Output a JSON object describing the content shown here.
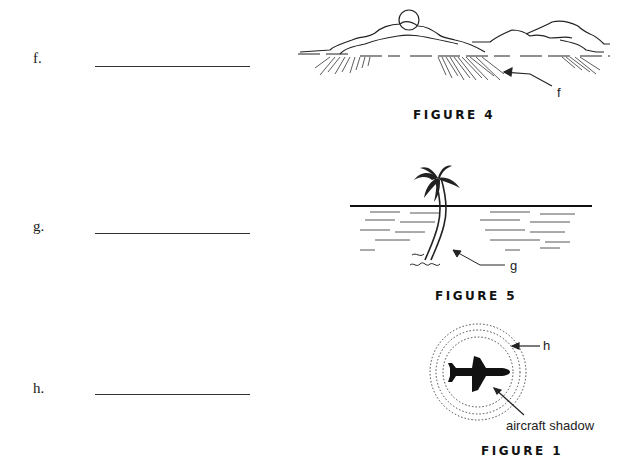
{
  "questions": [
    {
      "label": "f.",
      "answer": ""
    },
    {
      "label": "g.",
      "answer": ""
    },
    {
      "label": "h.",
      "answer": ""
    }
  ],
  "figures": [
    {
      "caption": "FIGURE 4",
      "callout": "f"
    },
    {
      "caption": "FIGURE 5",
      "callout": "g"
    },
    {
      "caption": "FIGURE 1",
      "callout": "h",
      "note": "aircraft shadow"
    }
  ]
}
